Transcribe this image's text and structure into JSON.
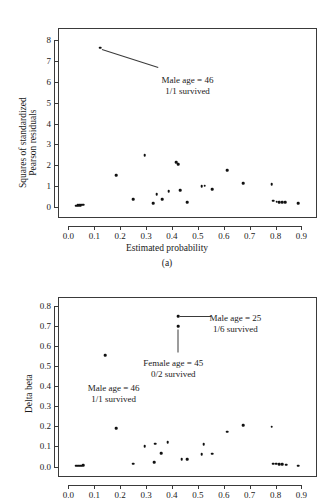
{
  "figure": {
    "panel_a_label": "(a)",
    "background": "#ffffff",
    "point_color": "#111111"
  },
  "chart_data": [
    {
      "type": "scatter",
      "id": "panel-a",
      "title": "",
      "panel_label": "(a)",
      "xlabel": "Estimated probability",
      "ylabel": "Squares of standardized Pearson residuals",
      "ylabel_line1": "Squares of standardized",
      "ylabel_line2": "Pearson residuals",
      "xlim": [
        -0.04,
        0.96
      ],
      "ylim": [
        -0.55,
        8.6
      ],
      "xticks": [
        0.0,
        0.1,
        0.2,
        0.3,
        0.4,
        0.5,
        0.6,
        0.7,
        0.8,
        0.9
      ],
      "xticklabels": [
        "0.0",
        "0.1",
        "0.2",
        "0.3",
        "0.4",
        "0.5",
        "0.6",
        "0.7",
        "0.8",
        "0.9"
      ],
      "yticks": [
        0,
        1,
        2,
        3,
        4,
        5,
        6,
        7,
        8
      ],
      "yticklabels": [
        "0",
        "1",
        "2",
        "3",
        "4",
        "5",
        "6",
        "7",
        "8"
      ],
      "grid": false,
      "legend": "none",
      "points": [
        {
          "x": 0.031,
          "y": 0.05
        },
        {
          "x": 0.036,
          "y": 0.06
        },
        {
          "x": 0.042,
          "y": 0.07
        },
        {
          "x": 0.047,
          "y": 0.08
        },
        {
          "x": 0.052,
          "y": 0.09
        },
        {
          "x": 0.058,
          "y": 0.1
        },
        {
          "x": 0.123,
          "y": 7.65
        },
        {
          "x": 0.184,
          "y": 1.5
        },
        {
          "x": 0.25,
          "y": 0.35
        },
        {
          "x": 0.295,
          "y": 2.48
        },
        {
          "x": 0.328,
          "y": 0.15
        },
        {
          "x": 0.341,
          "y": 0.6
        },
        {
          "x": 0.363,
          "y": 0.35
        },
        {
          "x": 0.388,
          "y": 0.75
        },
        {
          "x": 0.417,
          "y": 2.13
        },
        {
          "x": 0.425,
          "y": 2.04
        },
        {
          "x": 0.432,
          "y": 0.8
        },
        {
          "x": 0.458,
          "y": 0.22
        },
        {
          "x": 0.515,
          "y": 0.98
        },
        {
          "x": 0.527,
          "y": 1.0
        },
        {
          "x": 0.556,
          "y": 0.85
        },
        {
          "x": 0.613,
          "y": 1.75
        },
        {
          "x": 0.676,
          "y": 1.12
        },
        {
          "x": 0.785,
          "y": 1.08
        },
        {
          "x": 0.792,
          "y": 0.28
        },
        {
          "x": 0.805,
          "y": 0.24
        },
        {
          "x": 0.815,
          "y": 0.22
        },
        {
          "x": 0.826,
          "y": 0.21
        },
        {
          "x": 0.838,
          "y": 0.2
        },
        {
          "x": 0.888,
          "y": 0.15
        }
      ],
      "annotations": [
        {
          "id": "male-46",
          "line1": "Male age = 46",
          "line2": "1/1 survived",
          "text_x": 0.46,
          "text_y": 6.35,
          "leader_from": {
            "x": 0.131,
            "y": 7.58
          },
          "leader_to": {
            "x": 0.347,
            "y": 6.72
          }
        }
      ]
    },
    {
      "type": "scatter",
      "id": "panel-b",
      "title": "",
      "panel_label": "",
      "xlabel": "",
      "ylabel": "Delta beta",
      "xlim": [
        -0.04,
        0.96
      ],
      "ylim": [
        -0.052,
        0.845
      ],
      "xticks": [
        0.0,
        0.1,
        0.2,
        0.3,
        0.4,
        0.5,
        0.6,
        0.7,
        0.8,
        0.9
      ],
      "xticklabels": [
        "0.0",
        "0.1",
        "0.2",
        "0.3",
        "0.4",
        "0.5",
        "0.6",
        "0.7",
        "0.8",
        "0.9"
      ],
      "yticks": [
        0.0,
        0.1,
        0.2,
        0.3,
        0.4,
        0.5,
        0.6,
        0.7,
        0.8
      ],
      "yticklabels": [
        "0.0",
        "0.1",
        "0.2",
        "0.3",
        "0.4",
        "0.5",
        "0.6",
        "0.7",
        "0.8"
      ],
      "grid": false,
      "legend": "none",
      "points": [
        {
          "x": 0.031,
          "y": 0.004
        },
        {
          "x": 0.038,
          "y": 0.004
        },
        {
          "x": 0.045,
          "y": 0.005
        },
        {
          "x": 0.052,
          "y": 0.005
        },
        {
          "x": 0.058,
          "y": 0.006
        },
        {
          "x": 0.142,
          "y": 0.555
        },
        {
          "x": 0.184,
          "y": 0.192
        },
        {
          "x": 0.25,
          "y": 0.015
        },
        {
          "x": 0.295,
          "y": 0.102
        },
        {
          "x": 0.331,
          "y": 0.022
        },
        {
          "x": 0.336,
          "y": 0.114
        },
        {
          "x": 0.358,
          "y": 0.066
        },
        {
          "x": 0.383,
          "y": 0.122
        },
        {
          "x": 0.423,
          "y": 0.748
        },
        {
          "x": 0.423,
          "y": 0.7
        },
        {
          "x": 0.438,
          "y": 0.037
        },
        {
          "x": 0.458,
          "y": 0.038
        },
        {
          "x": 0.515,
          "y": 0.063
        },
        {
          "x": 0.523,
          "y": 0.111
        },
        {
          "x": 0.556,
          "y": 0.064
        },
        {
          "x": 0.613,
          "y": 0.174
        },
        {
          "x": 0.676,
          "y": 0.207
        },
        {
          "x": 0.785,
          "y": 0.198
        },
        {
          "x": 0.792,
          "y": 0.015
        },
        {
          "x": 0.803,
          "y": 0.014
        },
        {
          "x": 0.814,
          "y": 0.013
        },
        {
          "x": 0.826,
          "y": 0.012
        },
        {
          "x": 0.84,
          "y": 0.01
        },
        {
          "x": 0.888,
          "y": 0.004
        }
      ],
      "annotations": [
        {
          "id": "male-25",
          "line1": "Male age = 25",
          "line2": "1/6 survived",
          "text_x": 0.645,
          "text_y": 0.765,
          "leader_from": {
            "x": 0.432,
            "y": 0.748
          },
          "leader_to": {
            "x": 0.552,
            "y": 0.748
          }
        },
        {
          "id": "female-45",
          "line1": "Female age = 45",
          "line2": "0/2 survived",
          "text_x": 0.405,
          "text_y": 0.54,
          "leader_from": {
            "x": 0.423,
            "y": 0.685
          },
          "leader_to": {
            "x": 0.423,
            "y": 0.572
          }
        },
        {
          "id": "male-46",
          "line1": "Male age = 46",
          "line2": "1/1 survived",
          "text_x": 0.175,
          "text_y": 0.415,
          "leader_from": null,
          "leader_to": null
        }
      ]
    }
  ]
}
